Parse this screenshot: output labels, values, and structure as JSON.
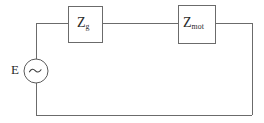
{
  "diagram": {
    "type": "electrical-circuit-schematic",
    "background_color": "#ffffff",
    "line_color": "#6b6b6b",
    "text_color": "#2a2a2a"
  },
  "source": {
    "name": "ac-voltage-source",
    "label": "E",
    "symbol": "sine-wave",
    "symbol_glyph": "∿",
    "center_x": 36,
    "center_y": 71,
    "radius": 12
  },
  "blocks": [
    {
      "name": "impedance-generator",
      "label_main": "Z",
      "label_sub": "g",
      "x": 68,
      "y": 6,
      "width": 34,
      "height": 36
    },
    {
      "name": "impedance-motor",
      "label_main": "Z",
      "label_sub": "mot",
      "x": 178,
      "y": 5,
      "width": 37,
      "height": 38
    }
  ],
  "wires": [
    {
      "name": "left-riser-upper",
      "d": "M 36 60 L 36 23"
    },
    {
      "name": "top-left-segment",
      "d": "M 36 23 L 68 23"
    },
    {
      "name": "top-middle-segment",
      "d": "M 102 23 L 178 23"
    },
    {
      "name": "top-right-segment",
      "d": "M 215 23 L 252 23"
    },
    {
      "name": "right-riser",
      "d": "M 252 23 L 252 115"
    },
    {
      "name": "bottom-return",
      "d": "M 252 115 L 36 115"
    },
    {
      "name": "left-riser-lower",
      "d": "M 36 115 L 36 83"
    }
  ]
}
